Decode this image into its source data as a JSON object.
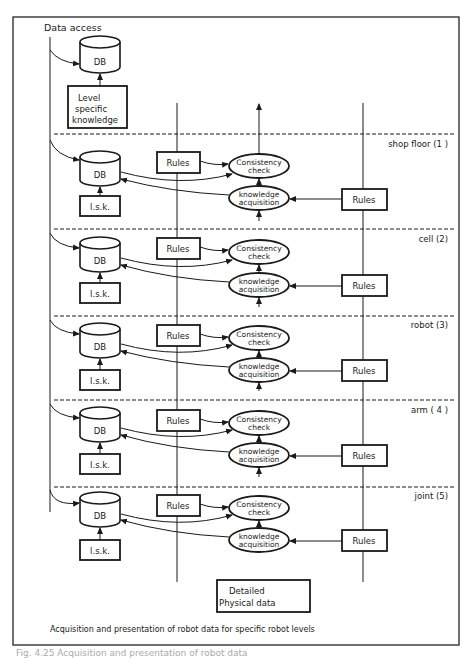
{
  "diagram": {
    "header_label": "Data access",
    "top_db_label": "DB",
    "top_knowledge_box": [
      "Level",
      "specific",
      "knowledge"
    ],
    "levels": [
      {
        "name": "shop floor (1 )",
        "db": "DB",
        "lsk": "l.s.k.",
        "rules_left": "Rules",
        "rules_right": "Rules",
        "consistency": [
          "Consistency",
          "check"
        ],
        "knowledge": [
          "knowledge",
          "acquisition"
        ]
      },
      {
        "name": "cell  (2)",
        "db": "DB",
        "lsk": "l.s.k.",
        "rules_left": "Rules",
        "rules_right": "Rules",
        "consistency": [
          "Consistency",
          "check"
        ],
        "knowledge": [
          "knowledge",
          "acquisition"
        ]
      },
      {
        "name": "robot (3)",
        "db": "DB",
        "lsk": "l.s.k.",
        "rules_left": "Rules",
        "rules_right": "Rules",
        "consistency": [
          "Consistency",
          "check"
        ],
        "knowledge": [
          "knowledge",
          "acquisition"
        ]
      },
      {
        "name": "arm ( 4 )",
        "db": "DB",
        "lsk": "l.s.k.",
        "rules_left": "Rules",
        "rules_right": "Rules",
        "consistency": [
          "Consistency",
          "check"
        ],
        "knowledge": [
          "knowledge",
          "acquisition"
        ]
      },
      {
        "name": "joint  (5)",
        "db": "DB",
        "lsk": "l.s.k.",
        "rules_left": "Rules",
        "rules_right": "Rules",
        "consistency": [
          "Consistency",
          "check"
        ],
        "knowledge": [
          "knowledge",
          "acquisition"
        ]
      }
    ],
    "bottom_box": [
      "Detailed",
      "Physical data"
    ],
    "caption": "Acquisition and presentation of robot data for specific robot levels",
    "figure_caption_partial": "Fig. 4.25  Acquisition and presentation of robot data"
  }
}
